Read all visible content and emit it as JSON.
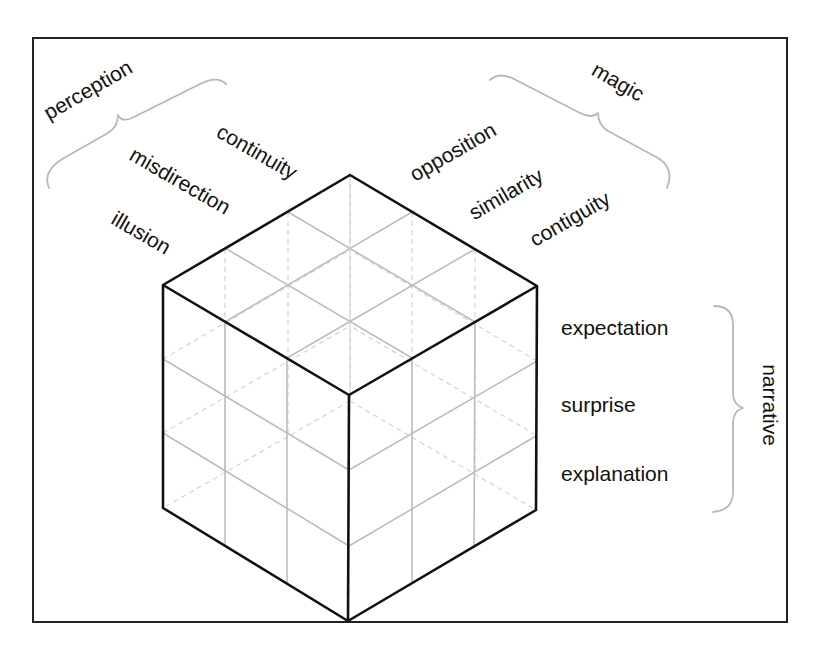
{
  "diagram": {
    "type": "isometric-cube-framework",
    "groups": {
      "perception": {
        "label": "perception",
        "items": [
          "continuity",
          "misdirection",
          "illusion"
        ]
      },
      "magic": {
        "label": "magic",
        "items": [
          "opposition",
          "similarity",
          "contiguity"
        ]
      },
      "narrative": {
        "label": "narrative",
        "items": [
          "expectation",
          "surprise",
          "explanation"
        ]
      }
    },
    "cube": {
      "divisions": 3,
      "edge_color": "#111111",
      "grid_color": "#bdbdbd",
      "brace_color": "#b8b8b8"
    }
  }
}
